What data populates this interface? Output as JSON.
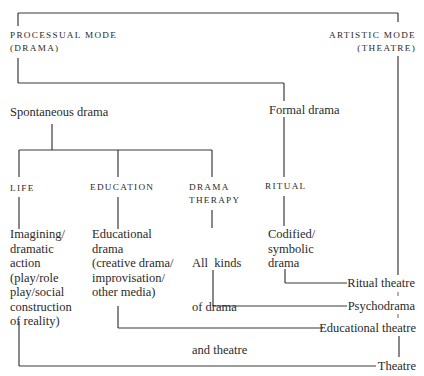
{
  "diagram": {
    "title_cropped": "AESTHETIC MODE OF ...",
    "modes": {
      "processual": {
        "line1": "PROCESSUAL MODE",
        "line2": "(DRAMA)"
      },
      "artistic": {
        "line1": "ARTISTIC MODE",
        "line2": "(THEATRE)"
      }
    },
    "branches": {
      "spontaneous": "Spontaneous drama",
      "formal": "Formal drama"
    },
    "categories": [
      {
        "label": [
          "LIFE"
        ],
        "description": [
          "Imagining/",
          "dramatic",
          "action",
          "(play/role",
          "play/social",
          "construction",
          "of reality)"
        ]
      },
      {
        "label": [
          "EDUCATION"
        ],
        "description": [
          "Educational",
          "drama",
          "(creative drama/",
          "improvisation/",
          "other media)"
        ]
      },
      {
        "label": [
          "DRAMA",
          "THERAPY"
        ],
        "description": [
          "All  kinds",
          "of drama",
          "and theatre"
        ]
      },
      {
        "label": [
          "RITUAL"
        ],
        "description": [
          "Codified/",
          "symbolic",
          "drama"
        ]
      }
    ],
    "outcomes": [
      "Ritual theatre",
      "Psychodrama",
      "Educational theatre",
      "Theatre"
    ]
  }
}
